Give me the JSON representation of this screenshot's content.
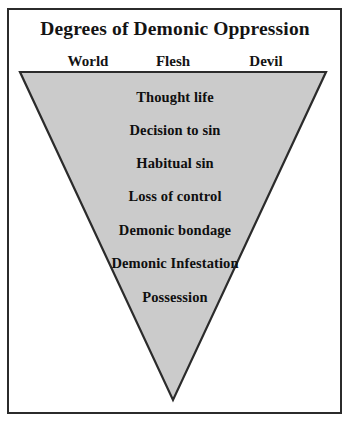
{
  "diagram": {
    "title": "Degrees of Demonic Oppression",
    "shape": "inverted-triangle",
    "fill_color": "#cbcbcb",
    "outline_color": "#2b2b2b",
    "background_color": "#ffffff",
    "frame_color": "#2b2b2b",
    "text_color": "#0f0f0f",
    "columns": [
      {
        "label": "World"
      },
      {
        "label": "Flesh"
      },
      {
        "label": "Devil"
      }
    ],
    "levels": [
      {
        "label": "Thought life"
      },
      {
        "label": "Decision to sin"
      },
      {
        "label": "Habitual sin"
      },
      {
        "label": "Loss of control"
      },
      {
        "label": "Demonic bondage"
      },
      {
        "label": "Demonic Infestation"
      },
      {
        "label": "Possession"
      }
    ]
  }
}
